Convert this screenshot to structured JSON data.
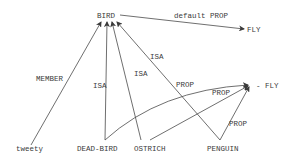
{
  "diagram": {
    "type": "semantic-network",
    "nodes": [
      {
        "id": "bird",
        "label": "BIRD"
      },
      {
        "id": "fly",
        "label": "FLY"
      },
      {
        "id": "not_fly",
        "label": "- FLY"
      },
      {
        "id": "tweety",
        "label": "tweety"
      },
      {
        "id": "dead_bird",
        "label": "DEAD-BIRD"
      },
      {
        "id": "ostrich",
        "label": "OSTRICH"
      },
      {
        "id": "penguin",
        "label": "PENGUIN"
      }
    ],
    "edges": [
      {
        "from": "bird",
        "to": "fly",
        "label": "default PROP"
      },
      {
        "from": "tweety",
        "to": "bird",
        "label": "MEMBER"
      },
      {
        "from": "dead_bird",
        "to": "bird",
        "label": "ISA"
      },
      {
        "from": "ostrich",
        "to": "bird",
        "label": "ISA"
      },
      {
        "from": "penguin",
        "to": "bird",
        "label": "ISA"
      },
      {
        "from": "dead_bird",
        "to": "not_fly",
        "label": "PROP"
      },
      {
        "from": "ostrich",
        "to": "not_fly",
        "label": "PROP"
      },
      {
        "from": "penguin",
        "to": "not_fly",
        "label": "PROP"
      }
    ]
  }
}
